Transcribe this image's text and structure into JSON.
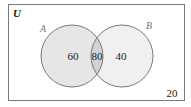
{
  "diagram": {
    "type": "venn",
    "universe_label": "U",
    "sets": [
      {
        "name": "A",
        "only_value": "60"
      },
      {
        "name": "B",
        "only_value": "40"
      }
    ],
    "intersection_value": "80",
    "outside_value": "20"
  },
  "colors": {
    "border": "#7a7a7a",
    "set_a_fill": "#e6e6e6",
    "set_b_fill": "#f0f0f0",
    "intersection_fill": "#d2d2d2",
    "text": "#222222",
    "set_label": "#777777"
  }
}
